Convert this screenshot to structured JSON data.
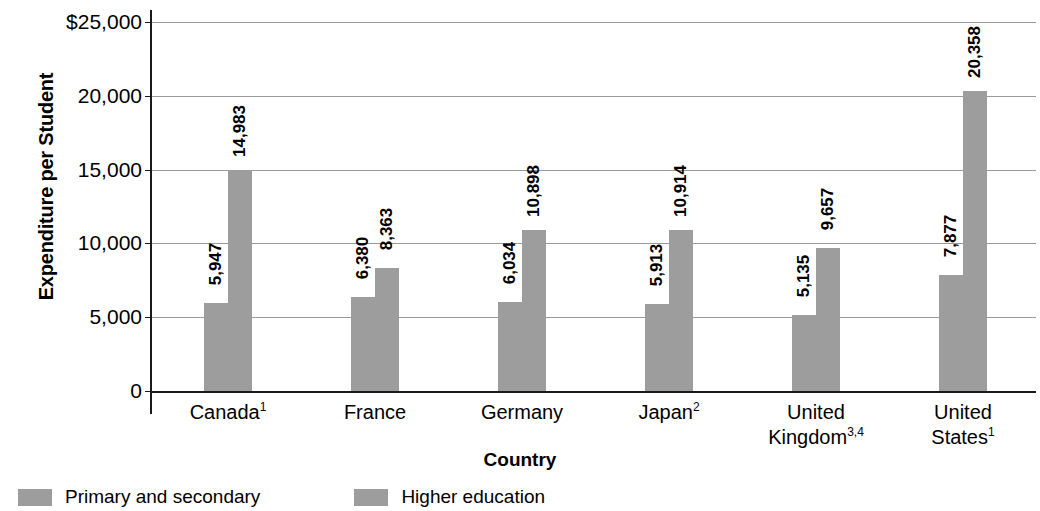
{
  "chart_data": {
    "type": "bar",
    "title": "",
    "xlabel": "Country",
    "ylabel": "Expenditure per Student",
    "ylim": [
      0,
      25000
    ],
    "ytick_labels": [
      "$25,000",
      "20,000",
      "15,000",
      "10,000",
      "5,000",
      "0"
    ],
    "ytick_values": [
      25000,
      20000,
      15000,
      10000,
      5000,
      0
    ],
    "grid": true,
    "legend_position": "bottom-left",
    "categories": [
      "Canada¹",
      "France",
      "Germany",
      "Japan²",
      "United Kingdom³,⁴",
      "United States¹"
    ],
    "category_lines": [
      [
        "Canada",
        "1"
      ],
      [
        "France",
        ""
      ],
      [
        "Germany",
        ""
      ],
      [
        "Japan",
        "2"
      ],
      [
        "United",
        "Kingdom",
        "3,4"
      ],
      [
        "United",
        "States",
        "1"
      ]
    ],
    "series": [
      {
        "name": "Primary and secondary",
        "color": "#9d9d9d",
        "values": [
          5947,
          6380,
          6034,
          5913,
          5135,
          7877
        ],
        "labels": [
          "5,947",
          "6,380",
          "6,034",
          "5,913",
          "5,135",
          "7,877"
        ]
      },
      {
        "name": "Higher education",
        "color": "#9d9d9d",
        "values": [
          14983,
          8363,
          10898,
          10914,
          9657,
          20358
        ],
        "labels": [
          "14,983",
          "8,363",
          "10,898",
          "10,914",
          "9,657",
          "20,358"
        ]
      }
    ]
  },
  "axes": {
    "y_title": "Expenditure per Student",
    "x_title": "Country"
  },
  "legend": {
    "items": [
      {
        "label": "Primary and secondary",
        "color": "#9d9d9d"
      },
      {
        "label": "Higher education",
        "color": "#9d9d9d"
      }
    ]
  },
  "colors": {
    "bar": "#9d9d9d",
    "axis": "#1a1a1a",
    "grid": "#9a9a9a",
    "text": "#000000",
    "background": "#ffffff"
  }
}
